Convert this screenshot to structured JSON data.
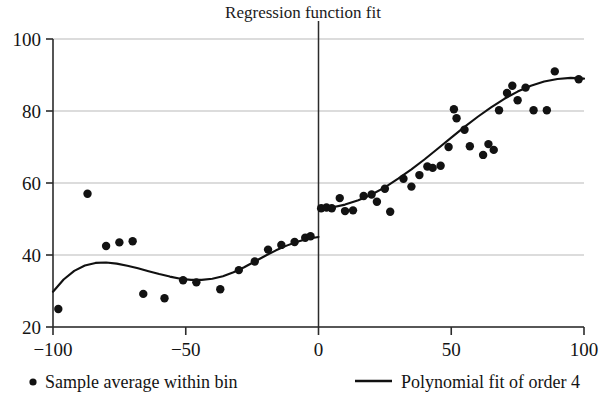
{
  "chart_data": {
    "type": "scatter",
    "title": "Regression function fit",
    "xlabel": "",
    "ylabel": "",
    "xlim": [
      -100,
      100
    ],
    "ylim": [
      20,
      100
    ],
    "xticks": [
      -100,
      -50,
      0,
      50,
      100
    ],
    "xtick_labels": [
      "−100",
      "−50",
      "0",
      "50",
      "100"
    ],
    "yticks": [
      20,
      40,
      60,
      80,
      100
    ],
    "ytick_labels": [
      "20",
      "40",
      "60",
      "80",
      "100"
    ],
    "grid": "horizontal",
    "legend_position": "below-axis",
    "cutoff": 0,
    "cutoff_line": true,
    "legend": [
      {
        "marker": "dot",
        "label": "Sample average within bin"
      },
      {
        "marker": "line",
        "label": "Polynomial fit of order 4"
      }
    ],
    "series": [
      {
        "name": "Sample average within bin",
        "marker": "dot",
        "color": "#121212",
        "points": [
          [
            -98,
            25.0
          ],
          [
            -87,
            57.0
          ],
          [
            -80,
            42.5
          ],
          [
            -75,
            43.5
          ],
          [
            -70,
            43.8
          ],
          [
            -66,
            29.2
          ],
          [
            -58,
            28.0
          ],
          [
            -51,
            33.0
          ],
          [
            -46,
            32.4
          ],
          [
            -37,
            30.5
          ],
          [
            -30,
            35.8
          ],
          [
            -24,
            38.2
          ],
          [
            -19,
            41.5
          ],
          [
            -14,
            42.8
          ],
          [
            -9,
            43.6
          ],
          [
            -5,
            44.8
          ],
          [
            -3,
            45.2
          ],
          [
            1,
            53.0
          ],
          [
            3,
            53.2
          ],
          [
            5,
            53.0
          ],
          [
            8,
            55.8
          ],
          [
            10,
            52.2
          ],
          [
            13,
            52.4
          ],
          [
            17,
            56.4
          ],
          [
            20,
            56.8
          ],
          [
            22,
            54.8
          ],
          [
            25,
            58.4
          ],
          [
            27,
            52.0
          ],
          [
            32,
            61.2
          ],
          [
            35,
            59.0
          ],
          [
            38,
            62.2
          ],
          [
            41,
            64.6
          ],
          [
            43,
            64.2
          ],
          [
            46,
            64.8
          ],
          [
            49,
            70.0
          ],
          [
            51,
            80.5
          ],
          [
            52,
            78.0
          ],
          [
            55,
            74.8
          ],
          [
            57,
            70.2
          ],
          [
            62,
            67.8
          ],
          [
            64,
            70.8
          ],
          [
            66,
            69.2
          ],
          [
            68,
            80.2
          ],
          [
            71,
            85.0
          ],
          [
            73,
            87.0
          ],
          [
            75,
            83.0
          ],
          [
            78,
            86.5
          ],
          [
            81,
            80.2
          ],
          [
            86,
            80.2
          ],
          [
            89,
            91.0
          ],
          [
            98,
            88.8
          ]
        ]
      },
      {
        "name": "Polynomial fit of order 4 (left of cutoff)",
        "marker": "line",
        "color": "#111111",
        "points": [
          [
            -100,
            29.8
          ],
          [
            -96,
            33.2
          ],
          [
            -92,
            35.6
          ],
          [
            -88,
            37.1
          ],
          [
            -84,
            37.8
          ],
          [
            -80,
            37.9
          ],
          [
            -76,
            37.6
          ],
          [
            -72,
            37.0
          ],
          [
            -68,
            36.3
          ],
          [
            -64,
            35.5
          ],
          [
            -60,
            34.7
          ],
          [
            -56,
            34.0
          ],
          [
            -52,
            33.4
          ],
          [
            -48,
            33.1
          ],
          [
            -44,
            33.1
          ],
          [
            -40,
            33.4
          ],
          [
            -36,
            34.1
          ],
          [
            -32,
            35.2
          ],
          [
            -28,
            36.6
          ],
          [
            -24,
            38.2
          ],
          [
            -20,
            39.8
          ],
          [
            -16,
            41.3
          ],
          [
            -12,
            42.6
          ],
          [
            -8,
            43.7
          ],
          [
            -4,
            44.5
          ],
          [
            0,
            45.0
          ]
        ]
      },
      {
        "name": "Polynomial fit of order 4 (right of cutoff)",
        "marker": "line",
        "color": "#111111",
        "points": [
          [
            0,
            52.6
          ],
          [
            5,
            53.2
          ],
          [
            10,
            54.0
          ],
          [
            15,
            55.2
          ],
          [
            20,
            56.8
          ],
          [
            25,
            58.8
          ],
          [
            30,
            61.2
          ],
          [
            35,
            63.8
          ],
          [
            40,
            66.6
          ],
          [
            45,
            69.6
          ],
          [
            50,
            72.6
          ],
          [
            55,
            75.6
          ],
          [
            60,
            78.4
          ],
          [
            65,
            81.0
          ],
          [
            70,
            83.4
          ],
          [
            75,
            85.4
          ],
          [
            80,
            87.0
          ],
          [
            85,
            88.2
          ],
          [
            90,
            88.9
          ],
          [
            95,
            89.2
          ],
          [
            100,
            89.0
          ]
        ]
      }
    ]
  }
}
